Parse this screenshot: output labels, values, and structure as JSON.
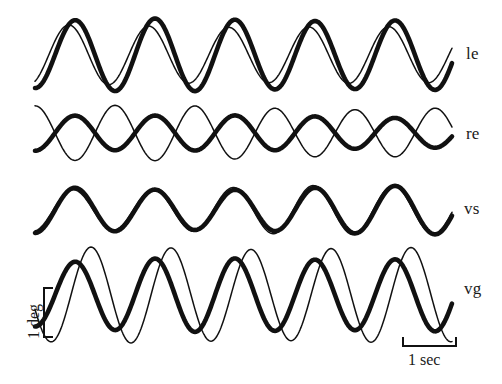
{
  "figure": {
    "background_color": "#ffffff",
    "trace_color": "#111111",
    "width": 502,
    "height": 384
  },
  "row_labels": [
    {
      "text": "le",
      "x": 466,
      "y": 45
    },
    {
      "text": "re",
      "x": 466,
      "y": 125
    },
    {
      "text": "vs",
      "x": 464,
      "y": 200
    },
    {
      "text": "vg",
      "x": 464,
      "y": 280
    }
  ],
  "scale_bars": {
    "vertical": {
      "label": "1 deg",
      "value": 1,
      "unit": "deg",
      "x": 44,
      "y_top": 288,
      "y_bottom": 337,
      "pixel_length": 49,
      "tick_length": 9,
      "label_x": 26,
      "label_y": 339
    },
    "horizontal": {
      "label": "1 sec",
      "value": 1,
      "unit": "sec",
      "y": 346,
      "x_left": 403,
      "x_right": 456,
      "pixel_length": 53,
      "tick_length": 9,
      "label_x": 408,
      "label_y": 352
    }
  },
  "chart_data": {
    "type": "line",
    "title": "",
    "xlabel": "",
    "ylabel": "",
    "grid": false,
    "legend": "none",
    "x_range_px": [
      35,
      452
    ],
    "x_units_per_px": 0.018868,
    "y_units_per_px": 0.020408,
    "time_span_sec": 7.87,
    "period_px": 80,
    "period_sec": 1.51,
    "frequency_hz": 0.66,
    "axis_note": "amplitude in degrees; time in seconds; calibration from scale bars",
    "rows": [
      {
        "label": "le",
        "description": "left eye",
        "baseline_y": 55,
        "series": [
          {
            "name": "le-thick",
            "style": "thick",
            "line_width": 4.6,
            "amplitude_px": 33,
            "amplitude_deg": 0.67,
            "phase_deg": 0,
            "period_px": 80,
            "waveform": "sine"
          },
          {
            "name": "le-thin",
            "style": "thin",
            "line_width": 1.5,
            "amplitude_px": 27,
            "amplitude_deg": 0.55,
            "phase_deg": 28,
            "period_px": 80,
            "waveform": "sine"
          }
        ],
        "phase_relation": "near in-phase, thin lags thick slightly"
      },
      {
        "label": "re",
        "description": "right eye",
        "baseline_y": 133,
        "series": [
          {
            "name": "re-thick",
            "style": "thick",
            "line_width": 4.6,
            "amplitude_px": 17,
            "amplitude_deg": 0.35,
            "phase_deg": 0,
            "period_px": 80,
            "waveform": "sine"
          },
          {
            "name": "re-thin",
            "style": "thin",
            "line_width": 1.5,
            "amplitude_px": 27,
            "amplitude_deg": 0.55,
            "phase_deg": 180,
            "period_px": 80,
            "waveform": "sine"
          }
        ],
        "phase_relation": "antiphase, 180 degrees out of phase"
      },
      {
        "label": "vs",
        "description": "vergence slow",
        "baseline_y": 210,
        "series": [
          {
            "name": "vs-thick",
            "style": "thick",
            "line_width": 4.6,
            "amplitude_px": 23,
            "amplitude_deg": 0.47,
            "phase_deg": 0,
            "period_px": 80,
            "waveform": "sine"
          },
          {
            "name": "vs-thin",
            "style": "thin",
            "line_width": 1.5,
            "amplitude_px": 23,
            "amplitude_deg": 0.47,
            "phase_deg": 8,
            "period_px": 80,
            "waveform": "sine"
          }
        ],
        "phase_relation": "in phase, traces nearly superimposed"
      },
      {
        "label": "vg",
        "description": "vergence gain",
        "baseline_y": 295,
        "series": [
          {
            "name": "vg-thick",
            "style": "thick",
            "line_width": 4.6,
            "amplitude_px": 34,
            "amplitude_deg": 0.69,
            "phase_deg": 0,
            "period_px": 80,
            "waveform": "sine"
          },
          {
            "name": "vg-thin",
            "style": "thin",
            "line_width": 1.5,
            "amplitude_px": 44,
            "amplitude_deg": 0.9,
            "phase_deg": -72,
            "period_px": 80,
            "waveform": "sine"
          }
        ],
        "phase_relation": "thin leads thick by about 72 degrees, thin larger amplitude"
      }
    ]
  }
}
